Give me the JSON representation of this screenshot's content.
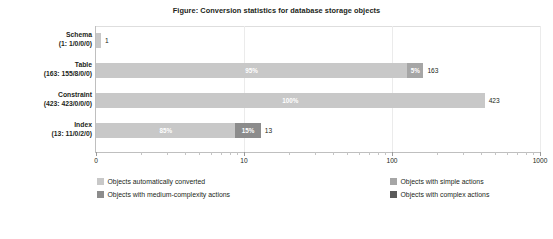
{
  "figure": {
    "title": "Figure: Conversion statistics for database storage objects"
  },
  "chart_data": {
    "type": "bar",
    "orientation": "horizontal",
    "stacked": true,
    "title": "Figure: Conversion statistics for database storage objects",
    "xlabel": "",
    "ylabel": "",
    "xscale": "log",
    "xlim": [
      1,
      1000
    ],
    "xticks": [
      0,
      10,
      100,
      1000
    ],
    "xtick_labels": [
      "0",
      "10",
      "100",
      "1000"
    ],
    "grid": true,
    "legend_position": "bottom",
    "categories": [
      "Schema",
      "Table",
      "Constraint",
      "Index"
    ],
    "category_labels": [
      {
        "name": "Schema",
        "detail": "(1: 1/0/0/0)"
      },
      {
        "name": "Table",
        "detail": "(163: 155/8/0/0)"
      },
      {
        "name": "Constraint",
        "detail": "(423: 423/0/0/0)"
      },
      {
        "name": "Index",
        "detail": "(13: 11/0/2/0)"
      }
    ],
    "series": [
      {
        "name": "Objects automatically converted",
        "color": "#c8c8c8",
        "values": [
          1,
          155,
          423,
          11
        ]
      },
      {
        "name": "Objects with simple actions",
        "color": "#a6a6a6",
        "values": [
          0,
          8,
          0,
          0
        ]
      },
      {
        "name": "Objects with medium-complexity actions",
        "color": "#8c8c8c",
        "values": [
          0,
          0,
          0,
          2
        ]
      },
      {
        "name": "Objects with complex actions",
        "color": "#5a5a5a",
        "values": [
          0,
          0,
          0,
          0
        ]
      }
    ],
    "totals": [
      "1",
      "163",
      "423",
      "13"
    ],
    "bar_segments": [
      {
        "category": "Schema",
        "total_label": "1",
        "segments": [
          {
            "series": "Objects automatically converted",
            "percent": "100%",
            "percent_value": 100,
            "value": 1,
            "color": "#c8c8c8",
            "label_shown": false
          }
        ]
      },
      {
        "category": "Table",
        "total_label": "163",
        "segments": [
          {
            "series": "Objects automatically converted",
            "percent": "95%",
            "percent_value": 95,
            "value": 155,
            "color": "#c8c8c8",
            "label_shown": true
          },
          {
            "series": "Objects with simple actions",
            "percent": "5%",
            "percent_value": 5,
            "value": 8,
            "color": "#a6a6a6",
            "label_shown": true
          }
        ]
      },
      {
        "category": "Constraint",
        "total_label": "423",
        "segments": [
          {
            "series": "Objects automatically converted",
            "percent": "100%",
            "percent_value": 100,
            "value": 423,
            "color": "#c8c8c8",
            "label_shown": true
          }
        ]
      },
      {
        "category": "Index",
        "total_label": "13",
        "segments": [
          {
            "series": "Objects automatically converted",
            "percent": "85%",
            "percent_value": 85,
            "value": 11,
            "color": "#c8c8c8",
            "label_shown": true
          },
          {
            "series": "Objects with medium-complexity actions",
            "percent": "15%",
            "percent_value": 15,
            "value": 2,
            "color": "#8c8c8c",
            "label_shown": true
          }
        ]
      }
    ],
    "legend": [
      {
        "label": "Objects automatically converted",
        "color": "#c8c8c8"
      },
      {
        "label": "Objects with simple actions",
        "color": "#a6a6a6"
      },
      {
        "label": "Objects with medium-complexity actions",
        "color": "#8c8c8c"
      },
      {
        "label": "Objects with complex actions",
        "color": "#5a5a5a"
      }
    ]
  }
}
